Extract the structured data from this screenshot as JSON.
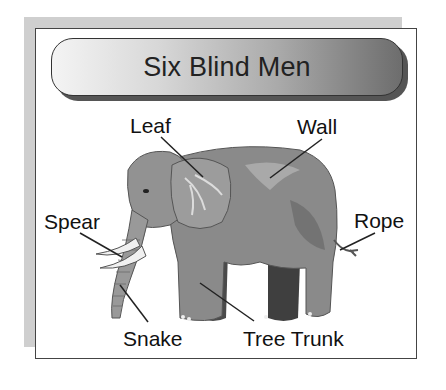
{
  "title": "Six Blind Men",
  "labels": {
    "leaf": "Leaf",
    "wall": "Wall",
    "spear": "Spear",
    "rope": "Rope",
    "snake": "Snake",
    "tree_trunk": "Tree Trunk"
  },
  "illustration": "elephant",
  "colors": {
    "body": "#8a8a8a",
    "body_dark": "#5a5a5a",
    "body_light": "#b0b0b0",
    "tusk": "#f0f0f0",
    "frame_shadow": "#cfcfcf"
  }
}
